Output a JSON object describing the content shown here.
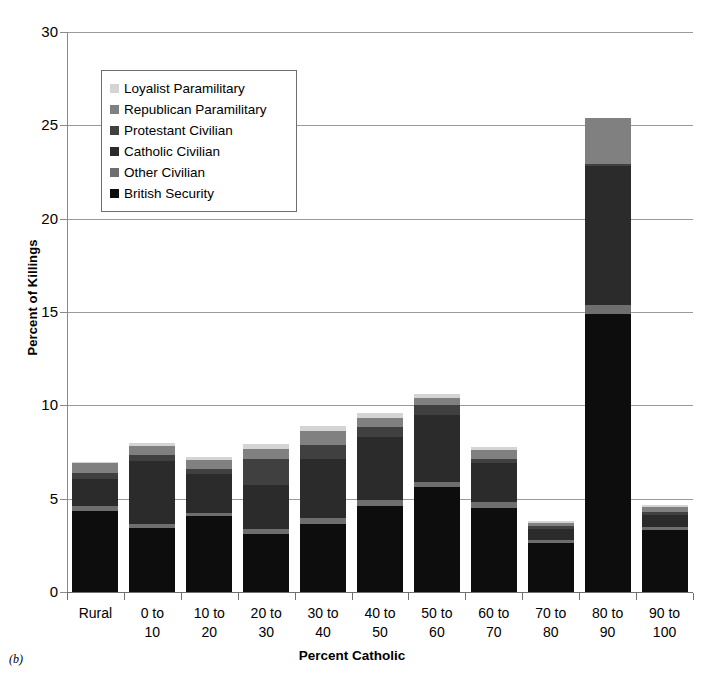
{
  "panel_label": "(b)",
  "legend": {
    "entries": [
      {
        "label": "Loyalist Paramilitary",
        "key": "loyalist",
        "color": "#d4d4d4"
      },
      {
        "label": "Republican Paramilitary",
        "key": "republican",
        "color": "#808080"
      },
      {
        "label": "Protestant Civilian",
        "key": "protestant",
        "color": "#404040"
      },
      {
        "label": "Catholic Civilian",
        "key": "catholic",
        "color": "#2b2b2b"
      },
      {
        "label": "Other Civilian",
        "key": "other",
        "color": "#6e6e6e"
      },
      {
        "label": "British Security",
        "key": "british",
        "color": "#0d0d0d"
      }
    ]
  },
  "chart_data": {
    "type": "bar",
    "subtype": "stacked",
    "title": "",
    "xlabel": "Percent Catholic",
    "ylabel": "Percent of Killings",
    "ylim": [
      0,
      30
    ],
    "yticks": [
      0,
      5,
      10,
      15,
      20,
      25,
      30
    ],
    "ytick_labels": [
      "0",
      "5",
      "10",
      "15",
      "20",
      "25",
      "30"
    ],
    "grid": true,
    "legend_position": "upper-left-inset",
    "categories": [
      "Rural",
      "0 to 10",
      "10 to 20",
      "20 to 30",
      "30 to 40",
      "40 to 50",
      "50 to 60",
      "60 to 70",
      "70 to 80",
      "80 to 90",
      "90 to 100"
    ],
    "series": [
      {
        "name": "British Security",
        "color": "#0d0d0d",
        "values": [
          4.35,
          3.45,
          4.05,
          3.1,
          3.65,
          4.6,
          5.6,
          4.5,
          2.65,
          14.9,
          3.3
        ]
      },
      {
        "name": "Other Civilian",
        "color": "#6e6e6e",
        "values": [
          0.25,
          0.2,
          0.2,
          0.3,
          0.3,
          0.35,
          0.3,
          0.3,
          0.15,
          0.45,
          0.2
        ]
      },
      {
        "name": "Catholic Civilian",
        "color": "#2b2b2b",
        "values": [
          1.45,
          3.35,
          2.05,
          2.35,
          3.15,
          3.35,
          3.6,
          2.1,
          0.55,
          7.45,
          0.65
        ]
      },
      {
        "name": "Protestant Civilian",
        "color": "#404040",
        "values": [
          0.35,
          0.35,
          0.3,
          1.4,
          0.75,
          0.55,
          0.5,
          0.25,
          0.2,
          0.15,
          0.15
        ]
      },
      {
        "name": "Republican Paramilitary",
        "color": "#808080",
        "values": [
          0.5,
          0.45,
          0.45,
          0.5,
          0.75,
          0.45,
          0.4,
          0.45,
          0.15,
          2.45,
          0.25
        ]
      },
      {
        "name": "Loyalist Paramilitary",
        "color": "#d4d4d4",
        "values": [
          0.05,
          0.2,
          0.2,
          0.3,
          0.3,
          0.3,
          0.2,
          0.15,
          0.1,
          0.0,
          0.1
        ]
      }
    ],
    "totals": [
      6.95,
      8.0,
      7.25,
      7.95,
      8.9,
      9.6,
      10.6,
      7.75,
      3.8,
      25.4,
      4.65
    ]
  }
}
